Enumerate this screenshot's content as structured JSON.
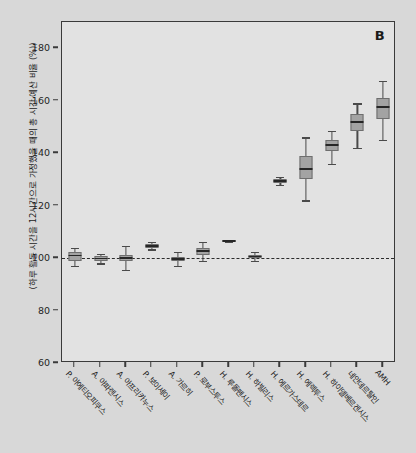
{
  "figure": {
    "panel_label": "B",
    "background_color": "#d8d8d8",
    "plot_background_color": "#e2e2e2",
    "frame_color": "#3a3a3a",
    "box_fill_color": "#a3a3a3",
    "box_edge_color": "#6e6e6e",
    "median_color": "#262626",
    "reference_line_color": "#2b2b2b"
  },
  "chart_data": {
    "type": "box",
    "title": "",
    "subtitle": "",
    "xlabel": "",
    "ylabel": "(하루 활동 시간을 12시간으로 가정했을 때의 총 시간 예산 비율 (%))",
    "ylim": [
      60,
      190
    ],
    "yticks": [
      60,
      80,
      100,
      120,
      140,
      160,
      180
    ],
    "ytick_labels": [
      "60",
      "80",
      "100",
      "120",
      "140",
      "160",
      "180"
    ],
    "grid": false,
    "legend": "none",
    "annotations": [
      {
        "text": "B",
        "position": "top-right"
      }
    ],
    "reference_lines": [
      {
        "orientation": "horizontal",
        "value": 100,
        "style": "dashed"
      }
    ],
    "categories": [
      "P. 아에티오피쿠스",
      "A. 아파렌시스",
      "A. 아프리카누스",
      "P. 보이세이",
      "A. 가르히",
      "P. 로부스투스",
      "H. 루돌펜시스",
      "H. 하빌리스",
      "H. 에르가스테르",
      "H. 에렉투스",
      "H. 하이델베르겐시스",
      "네안데르탈인",
      "AMH"
    ],
    "boxes": [
      {
        "category": "P. 아에티오피쿠스",
        "whisker_low": 97.0,
        "q1": 99.0,
        "median": 101.0,
        "q3": 102.5,
        "whisker_high": 104.0
      },
      {
        "category": "A. 아파렌시스",
        "whisker_low": 98.0,
        "q1": 99.0,
        "median": 99.8,
        "q3": 100.7,
        "whisker_high": 101.6
      },
      {
        "category": "A. 아프리카누스",
        "whisker_low": 95.5,
        "q1": 98.8,
        "median": 100.0,
        "q3": 101.2,
        "whisker_high": 104.5
      },
      {
        "category": "P. 보이세이",
        "whisker_low": 103.3,
        "q1": 104.0,
        "median": 104.7,
        "q3": 105.4,
        "whisker_high": 106.1
      },
      {
        "category": "A. 가르히",
        "whisker_low": 97.0,
        "q1": 98.8,
        "median": 99.6,
        "q3": 100.4,
        "whisker_high": 102.2
      },
      {
        "category": "P. 로부스투스",
        "whisker_low": 99.0,
        "q1": 101.3,
        "median": 102.6,
        "q3": 103.9,
        "whisker_high": 106.2
      },
      {
        "category": "H. 루돌펜시스",
        "whisker_low": 106.3,
        "q1": 106.4,
        "median": 106.6,
        "q3": 106.8,
        "whisker_high": 106.9
      },
      {
        "category": "H. 하빌리스",
        "whisker_low": 99.0,
        "q1": 100.0,
        "median": 100.6,
        "q3": 101.3,
        "whisker_high": 102.3
      },
      {
        "category": "H. 에르가스테르",
        "whisker_low": 128.0,
        "q1": 128.8,
        "median": 129.5,
        "q3": 130.3,
        "whisker_high": 131.0
      },
      {
        "category": "H. 에렉투스",
        "whisker_low": 122.0,
        "q1": 130.0,
        "median": 134.0,
        "q3": 139.0,
        "whisker_high": 146.0
      },
      {
        "category": "H. 하이델베르겐시스",
        "whisker_low": 136.0,
        "q1": 141.0,
        "median": 143.0,
        "q3": 145.0,
        "whisker_high": 148.5
      },
      {
        "category": "네안데르탈인",
        "whisker_low": 142.0,
        "q1": 148.5,
        "median": 152.0,
        "q3": 155.0,
        "whisker_high": 159.0
      },
      {
        "category": "AMH",
        "whisker_low": 145.0,
        "q1": 153.0,
        "median": 157.5,
        "q3": 161.0,
        "whisker_high": 167.5
      }
    ]
  }
}
